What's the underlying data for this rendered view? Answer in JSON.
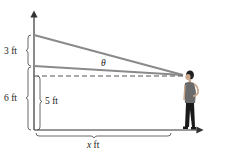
{
  "diagram": {
    "labels": {
      "upper_height": "3 ft",
      "total_height": "6 ft",
      "eye_height": "5 ft",
      "distance_var": "x",
      "distance_unit": " ft",
      "angle": "θ"
    },
    "colors": {
      "lines": "#8a8a8a",
      "axis": "#333333",
      "text": "#222222",
      "person_shirt": "#6b6b6b",
      "person_pants": "#1a1a1a"
    }
  }
}
